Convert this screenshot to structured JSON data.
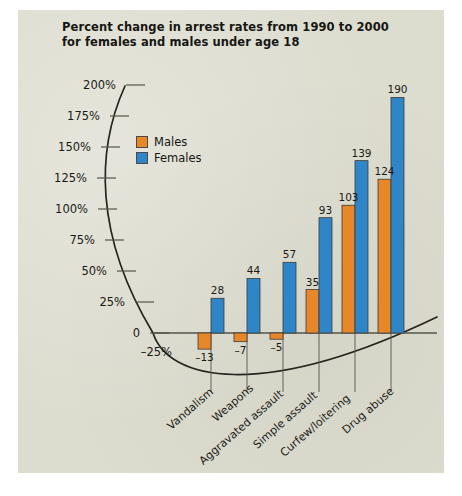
{
  "title": {
    "line1": "Percent change in arrest rates from 1990 to 2000",
    "line2": "for females and males under age 18"
  },
  "legend": {
    "position": "inside-top-left",
    "items": [
      {
        "label": "Males",
        "color": "#e8862a"
      },
      {
        "label": "Females",
        "color": "#2e86c8"
      }
    ]
  },
  "axis": {
    "ticks": [
      "200%",
      "175%",
      "150%",
      "125%",
      "100%",
      "75%",
      "50%",
      "25%",
      "0",
      "–25%"
    ],
    "tick_values": [
      200,
      175,
      150,
      125,
      100,
      75,
      50,
      25,
      0,
      -25
    ]
  },
  "chart_data": {
    "type": "bar",
    "title": "Percent change in arrest rates from 1990 to 2000 for females and males under age 18",
    "xlabel": "",
    "ylabel": "",
    "ylim": [
      -25,
      200
    ],
    "grid": false,
    "legend_position": "inside-top-left",
    "categories": [
      "Vandalism",
      "Weapons",
      "Aggravated assault",
      "Simple assault",
      "Curfew/loitering",
      "Drug abuse"
    ],
    "series": [
      {
        "name": "Males",
        "color": "#e8862a",
        "values": [
          -13,
          -7,
          -5,
          35,
          103,
          124
        ]
      },
      {
        "name": "Females",
        "color": "#2e86c8",
        "values": [
          28,
          44,
          57,
          93,
          139,
          190
        ]
      }
    ],
    "data_labels": {
      "Males": [
        "–13",
        "–7",
        "–5",
        "35",
        "103",
        "124"
      ],
      "Females": [
        "28",
        "44",
        "57",
        "93",
        "139",
        "190"
      ]
    }
  },
  "colors": {
    "panel": "#dcdccf",
    "males": "#e8862a",
    "females": "#2e86c8",
    "axis": "#25251e",
    "text": "#161612"
  }
}
